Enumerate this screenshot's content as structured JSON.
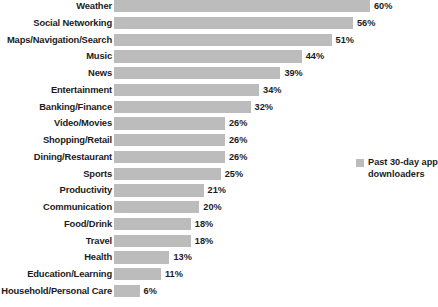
{
  "chart_data": {
    "type": "bar",
    "orientation": "horizontal",
    "title": "",
    "xlabel": "",
    "ylabel": "",
    "xlim": [
      0,
      60
    ],
    "grid": false,
    "legend_position": "right",
    "value_suffix": "%",
    "categories": [
      "Weather",
      "Social Networking",
      "Maps/Navigation/Search",
      "Music",
      "News",
      "Entertainment",
      "Banking/Finance",
      "Video/Movies",
      "Shopping/Retail",
      "Dining/Restaurant",
      "Sports",
      "Productivity",
      "Communication",
      "Food/Drink",
      "Travel",
      "Health",
      "Education/Learning",
      "Household/Personal Care"
    ],
    "values": [
      60,
      56,
      51,
      44,
      39,
      34,
      32,
      26,
      26,
      26,
      25,
      21,
      20,
      18,
      18,
      13,
      11,
      6
    ],
    "value_labels": [
      "60%",
      "56%",
      "51%",
      "44%",
      "39%",
      "34%",
      "32%",
      "26%",
      "26%",
      "26%",
      "25%",
      "21%",
      "20%",
      "18%",
      "18%",
      "13%",
      "11%",
      "6%"
    ],
    "series": [
      {
        "name": "Past 30-day app downloaders",
        "color": "#bcbcbc",
        "values": [
          60,
          56,
          51,
          44,
          39,
          34,
          32,
          26,
          26,
          26,
          25,
          21,
          20,
          18,
          18,
          13,
          11,
          6
        ]
      }
    ]
  },
  "legend": {
    "label": "Past 30-day app downloaders",
    "color": "#bcbcbc"
  }
}
